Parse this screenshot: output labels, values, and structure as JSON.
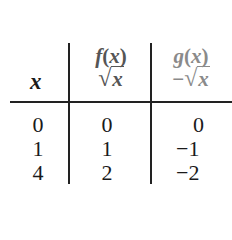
{
  "table": {
    "headers": {
      "x": "x",
      "f": {
        "name": "f(x)",
        "expr_prefix": "",
        "radical": "√",
        "radicand": "x"
      },
      "g": {
        "name": "g(x)",
        "expr_prefix": "−",
        "radical": "√",
        "radicand": "x"
      }
    },
    "rows": [
      {
        "x": "0",
        "f": "0",
        "g": "0"
      },
      {
        "x": "1",
        "f": "1",
        "g": "−1"
      },
      {
        "x": "4",
        "f": "2",
        "g": "−2"
      }
    ],
    "colors": {
      "f_header": "#555555",
      "g_header": "#8a8a8a",
      "lines": "#222222"
    }
  }
}
